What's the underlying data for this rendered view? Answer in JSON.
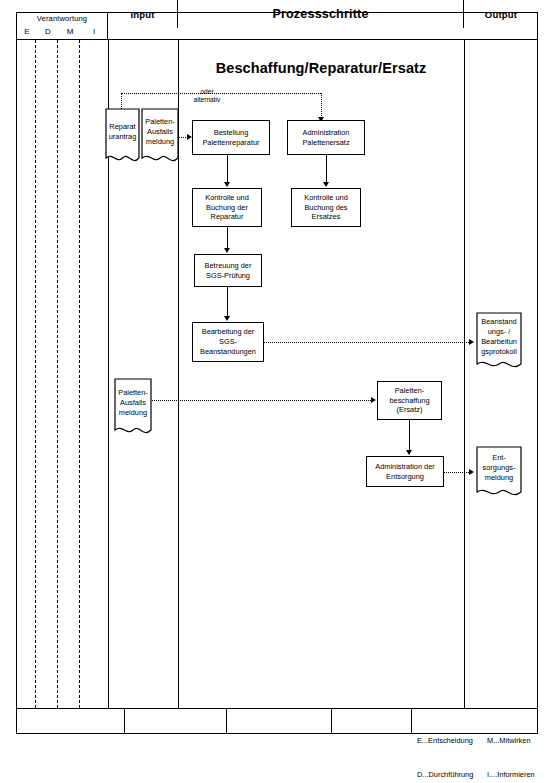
{
  "header": {
    "responsibility_title": "Verantwortung",
    "responsibility_letters": [
      "E",
      "D",
      "M",
      "I"
    ],
    "columns": [
      {
        "label": "Input"
      },
      {
        "label": "Prozessschritte"
      },
      {
        "label": "Output"
      }
    ]
  },
  "diagram": {
    "title": "Beschaffung/Reparatur/Ersatz",
    "alternative_label_line1": "oder",
    "alternative_label_line2": "alternativ",
    "inputs": [
      {
        "id": "reparaturantrag",
        "label": "Reparat\nurantrag"
      },
      {
        "id": "palettenausfallsmeldung-1",
        "label": "Paletten-\nAusfalls\nmeldung"
      },
      {
        "id": "palettenausfallsmeldung-2",
        "label": "Paletten-\nAusfalls\nmeldung"
      }
    ],
    "steps": [
      {
        "id": "bestellung-palettenreparatur",
        "label": "Bestellung\nPalettenreparatur"
      },
      {
        "id": "administration-palettenersatz",
        "label": "Administration\nPalettenersatz"
      },
      {
        "id": "kontrolle-buchung-reparatur",
        "label": "Kontrolle und\nBuchung der\nReparatur"
      },
      {
        "id": "kontrolle-buchung-ersatz",
        "label": "Kontrolle und\nBuchung des\nErsatzes"
      },
      {
        "id": "betreuung-sgs-pruefung",
        "label": "Betreuung der\nSGS-Prüfung"
      },
      {
        "id": "bearbeitung-sgs-beanstandungen",
        "label": "Bearbeitung der\nSGS-\nBeanstandungen"
      },
      {
        "id": "palettenbeschaffung-ersatz",
        "label": "Paletten-\nbeschaffung\n(Ersatz)"
      },
      {
        "id": "administration-entsorgung",
        "label": "Administration der\nEntsorgung"
      }
    ],
    "outputs": [
      {
        "id": "beanstandungsprotokoll",
        "label": "Beanstand\nungs- /\nBearbeitun\ngsprotokoll"
      },
      {
        "id": "entsorgungsmeldung",
        "label": "Ent-\nsorgungs-\nmeldung"
      }
    ]
  },
  "footer": {
    "legend": [
      {
        "key": "E...",
        "text": "Entscheidung"
      },
      {
        "key": "D...",
        "text": "Durchführung"
      },
      {
        "key": "M...",
        "text": "Mitwirken"
      },
      {
        "key": "I....",
        "text": "Informieren"
      }
    ]
  }
}
